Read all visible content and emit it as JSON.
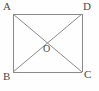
{
  "figure": {
    "type": "geometry-diagram",
    "shape": "rectangle-with-diagonals",
    "caption": "",
    "stroke_color": "#8a8a8a",
    "label_color": "#4a4a4a",
    "background_color": "#fefefe",
    "canvas": {
      "width": 99,
      "height": 91
    },
    "rectangle": {
      "left": 13,
      "top": 14,
      "right": 82,
      "bottom": 72,
      "width": 69,
      "height": 58
    },
    "vertices": [
      {
        "id": "A",
        "label": "A",
        "role": "top-left-vertex",
        "x": 13,
        "y": 14
      },
      {
        "id": "D",
        "label": "D",
        "role": "top-right-vertex",
        "x": 82,
        "y": 14
      },
      {
        "id": "B",
        "label": "B",
        "role": "bottom-left-vertex",
        "x": 13,
        "y": 72
      },
      {
        "id": "C",
        "label": "C",
        "role": "bottom-right-vertex",
        "x": 82,
        "y": 72
      }
    ],
    "intersection": {
      "id": "O",
      "label": "O",
      "role": "diagonal-intersection-point",
      "x": 47.5,
      "y": 43
    },
    "edges": [
      {
        "id": "AD",
        "from": "A",
        "to": "D",
        "kind": "side"
      },
      {
        "id": "DC",
        "from": "D",
        "to": "C",
        "kind": "side"
      },
      {
        "id": "CB",
        "from": "C",
        "to": "B",
        "kind": "side"
      },
      {
        "id": "BA",
        "from": "B",
        "to": "A",
        "kind": "side"
      },
      {
        "id": "AC",
        "from": "A",
        "to": "C",
        "kind": "diagonal"
      },
      {
        "id": "BD",
        "from": "B",
        "to": "D",
        "kind": "diagonal"
      }
    ]
  }
}
